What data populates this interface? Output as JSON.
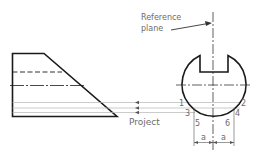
{
  "diagram": {
    "labels": {
      "reference_line1": "Reference",
      "reference_line2": "plane",
      "project": "Project",
      "dim_left": "a",
      "dim_right": "a"
    },
    "points": [
      {
        "id": "1",
        "label": "1"
      },
      {
        "id": "2",
        "label": "2"
      },
      {
        "id": "3",
        "label": "3"
      },
      {
        "id": "4",
        "label": "4"
      },
      {
        "id": "5",
        "label": "5"
      },
      {
        "id": "6",
        "label": "6"
      }
    ],
    "colors": {
      "outline": "#1a1a1a",
      "projection": "#b0b0b0",
      "text": "#6b6b6b"
    }
  }
}
